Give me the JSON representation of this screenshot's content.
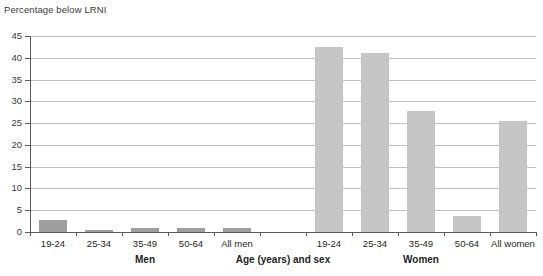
{
  "chart_data": {
    "type": "bar",
    "title": "",
    "ylabel": "Percentage below LRNI",
    "xlabel": "Age (years) and sex",
    "ylim": [
      0,
      45
    ],
    "ytick_step": 5,
    "grid": true,
    "legend": "none",
    "categories": [
      "19-24",
      "25-34",
      "35-49",
      "50-64",
      "All men",
      "",
      "19-24",
      "25-34",
      "35-49",
      "50-64",
      "All women"
    ],
    "values": [
      2.7,
      0.5,
      1.0,
      1.0,
      1.0,
      null,
      42.5,
      41.0,
      27.8,
      3.7,
      25.5
    ],
    "groups": [
      {
        "label": "Men",
        "categories": [
          "19-24",
          "25-34",
          "35-49",
          "50-64",
          "All men"
        ],
        "values": [
          2.7,
          0.5,
          1.0,
          1.0,
          1.0
        ],
        "color": "#9e9e9e"
      },
      {
        "label": "Women",
        "categories": [
          "19-24",
          "25-34",
          "35-49",
          "50-64",
          "All women"
        ],
        "values": [
          42.5,
          41.0,
          27.8,
          3.7,
          25.5
        ],
        "color": "#c6c6c6"
      }
    ],
    "ytick_labels": [
      "0",
      "5",
      "10",
      "15",
      "20",
      "25",
      "30",
      "35",
      "40",
      "45"
    ]
  },
  "labels": {
    "y_axis_title": "Percentage below LRNI",
    "x_axis_title": "Age (years) and sex",
    "group_men": "Men",
    "group_women": "Women"
  },
  "colors": {
    "bar_men": "#9e9e9e",
    "bar_women": "#c6c6c6",
    "gridline": "#bfbfbf",
    "axis": "#5b5b5b",
    "text": "#231f20",
    "background": "#ffffff"
  }
}
